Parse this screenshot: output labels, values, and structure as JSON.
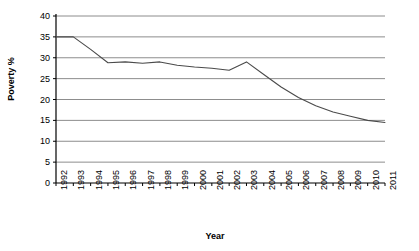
{
  "chart_data": {
    "type": "line",
    "title": "",
    "xlabel": "Year",
    "ylabel": "Poverty %",
    "categories": [
      "1992",
      "1993",
      "1994",
      "1995",
      "1996",
      "1997",
      "1998",
      "1999",
      "2000",
      "2001",
      "2002",
      "2003",
      "2004",
      "2005",
      "2006",
      "2007",
      "2008",
      "2009",
      "2010",
      "2011"
    ],
    "values": [
      35,
      35,
      32,
      28.8,
      29,
      28.7,
      29,
      28.2,
      27.8,
      27.5,
      27,
      29,
      26,
      23,
      20.5,
      18.5,
      17,
      16,
      15,
      14.5
    ],
    "ylim": [
      0,
      40
    ],
    "yticks": [
      "0",
      "5",
      "10",
      "15",
      "20",
      "25",
      "30",
      "35",
      "40"
    ],
    "ytick_values": [
      0,
      5,
      10,
      15,
      20,
      25,
      30,
      35,
      40
    ],
    "grid": "horizontal",
    "legend": "none",
    "series_color": "#4a4a4a",
    "grid_color": "#808080",
    "axis_color": "#000000"
  },
  "axes": {
    "y_axis_label": "Poverty %",
    "x_axis_label": "Year"
  }
}
